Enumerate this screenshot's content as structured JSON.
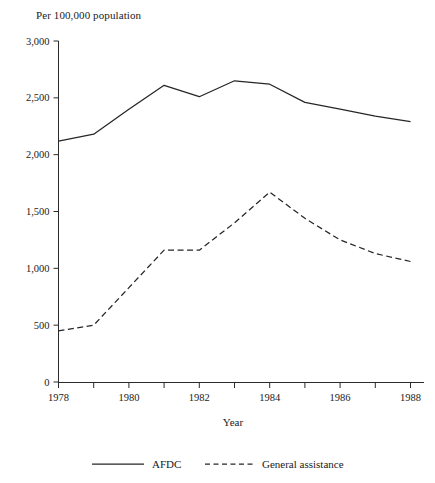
{
  "chart_data": {
    "type": "line",
    "title": "Per 100,000 population",
    "xlabel": "Year",
    "ylabel": "",
    "x": [
      1978,
      1979,
      1980,
      1981,
      1982,
      1983,
      1984,
      1985,
      1986,
      1987,
      1988
    ],
    "xlim": [
      1978,
      1988
    ],
    "ylim": [
      0,
      3000
    ],
    "grid": false,
    "legend_position": "bottom",
    "x_tick_values": [
      1978,
      1979,
      1980,
      1981,
      1982,
      1983,
      1984,
      1985,
      1986,
      1987,
      1988
    ],
    "x_tick_labels": [
      "1978",
      "",
      "1980",
      "",
      "1982",
      "",
      "1984",
      "",
      "1986",
      "",
      "1988"
    ],
    "y_tick_values": [
      0,
      500,
      1000,
      1500,
      2000,
      2500,
      3000
    ],
    "y_tick_labels": [
      "0",
      "500",
      "1,000",
      "1,500",
      "2,000",
      "2,500",
      "3,000"
    ],
    "series": [
      {
        "name": "AFDC",
        "style": "solid",
        "values": [
          2120,
          2180,
          2400,
          2610,
          2510,
          2650,
          2620,
          2460,
          2400,
          2340,
          2290
        ]
      },
      {
        "name": "General assistance",
        "style": "dashed",
        "values": [
          450,
          500,
          830,
          1160,
          1160,
          1400,
          1670,
          1440,
          1250,
          1130,
          1060
        ]
      }
    ]
  },
  "legend": {
    "entries": [
      {
        "label": "AFDC",
        "style": "solid"
      },
      {
        "label": "General assistance",
        "style": "dashed"
      }
    ]
  }
}
